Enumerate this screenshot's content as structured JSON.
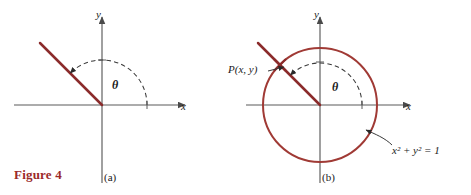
{
  "figure": {
    "caption": "Figure 4",
    "colors": {
      "ray": "#8B2B2B",
      "circle": "#A03A35",
      "axis": "#5a5a5a",
      "arc": "#3a3a3a",
      "caption": "#9c2a2a",
      "text": "#1a1a1a",
      "background": "#ffffff"
    }
  },
  "panel_a": {
    "label": "(a)",
    "x_axis_label": "x",
    "y_axis_label": "y",
    "angle_label": "θ",
    "origin": {
      "x": 102,
      "y": 105
    },
    "ray_angle_degrees": 135,
    "ray_length": 88,
    "arc_radius": 45,
    "arc_start_degrees": 0,
    "arc_end_degrees": 135
  },
  "panel_b": {
    "label": "(b)",
    "x_axis_label": "x",
    "y_axis_label": "y",
    "angle_label": "θ",
    "point_label": "P(x, y)",
    "circle_equation_base": "x",
    "circle_equation": "x² + y² = 1",
    "origin": {
      "x": 320,
      "y": 105
    },
    "circle_radius": 57,
    "ray_angle_degrees": 135,
    "ray_length": 88,
    "arc_radius": 42,
    "arc_start_degrees": 0,
    "arc_end_degrees": 135,
    "point_on_circle": {
      "x": 280,
      "y": 65
    }
  }
}
